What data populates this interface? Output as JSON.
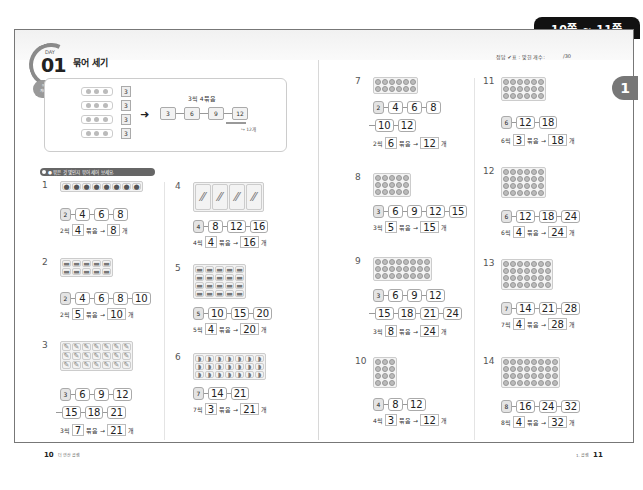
{
  "header": {
    "page_range": "10쪽 ~ 11쪽",
    "score_label": "정답 ✔표 : 맞힌 개수:",
    "score_total": "/30",
    "chapter_badge": "1"
  },
  "lesson": {
    "day_label": "DAY",
    "day_number": "01",
    "title": "묶어 세기",
    "tag_line1": "어떻게",
    "tag_line2": "계산해요"
  },
  "example": {
    "group_values": [
      "3",
      "3",
      "3",
      "3"
    ],
    "caption": "3씩 4묶음",
    "chain": [
      "3",
      "6",
      "9",
      "12"
    ],
    "result_note": "12개"
  },
  "section_label": "● 묶은 것 몇인지 묶어 세어 보세요.",
  "problems": [
    {
      "num": "1",
      "chain": [
        [
          "2",
          "4",
          "6",
          "8"
        ]
      ],
      "step": "2",
      "groups": "4",
      "total": "8"
    },
    {
      "num": "2",
      "chain": [
        [
          "2",
          "4",
          "6",
          "8",
          "10"
        ]
      ],
      "step": "2",
      "groups": "5",
      "total": "10"
    },
    {
      "num": "3",
      "chain": [
        [
          "3",
          "6",
          "9",
          "12"
        ],
        [
          "15",
          "18",
          "21"
        ]
      ],
      "step": "3",
      "groups": "7",
      "total": "21"
    },
    {
      "num": "4",
      "chain": [
        [
          "4",
          "8",
          "12",
          "16"
        ]
      ],
      "step": "4",
      "groups": "4",
      "total": "16"
    },
    {
      "num": "5",
      "chain": [
        [
          "5",
          "10",
          "15",
          "20"
        ]
      ],
      "step": "5",
      "groups": "4",
      "total": "20"
    },
    {
      "num": "6",
      "chain": [
        [
          "7",
          "14",
          "21"
        ]
      ],
      "step": "7",
      "groups": "3",
      "total": "21"
    },
    {
      "num": "7",
      "chain": [
        [
          "2",
          "4",
          "6",
          "8"
        ],
        [
          "10",
          "12"
        ]
      ],
      "step": "2",
      "groups": "6",
      "total": "12"
    },
    {
      "num": "8",
      "chain": [
        [
          "3",
          "6",
          "9",
          "12",
          "15"
        ]
      ],
      "step": "3",
      "groups": "5",
      "total": "15"
    },
    {
      "num": "9",
      "chain": [
        [
          "3",
          "6",
          "9",
          "12"
        ],
        [
          "15",
          "18",
          "21",
          "24"
        ]
      ],
      "step": "3",
      "groups": "8",
      "total": "24"
    },
    {
      "num": "10",
      "chain": [
        [
          "4",
          "8",
          "12"
        ]
      ],
      "step": "4",
      "groups": "3",
      "total": "12"
    },
    {
      "num": "11",
      "chain": [
        [
          "6",
          "12",
          "18"
        ]
      ],
      "step": "6",
      "groups": "3",
      "total": "18"
    },
    {
      "num": "12",
      "chain": [
        [
          "6",
          "12",
          "18",
          "24"
        ]
      ],
      "step": "6",
      "groups": "4",
      "total": "24"
    },
    {
      "num": "13",
      "chain": [
        [
          "7",
          "14",
          "21",
          "28"
        ]
      ],
      "step": "7",
      "groups": "4",
      "total": "28"
    },
    {
      "num": "14",
      "chain": [
        [
          "8",
          "16",
          "24",
          "32"
        ]
      ],
      "step": "8",
      "groups": "4",
      "total": "32"
    }
  ],
  "answer_words": {
    "per": "씩",
    "bundle": "묶음",
    "arrow": "→",
    "unit": "개"
  },
  "footer": {
    "left_page": "10",
    "left_text": "더 연산 곱셈",
    "right_text": "1. 곱셈",
    "right_page": "11"
  }
}
